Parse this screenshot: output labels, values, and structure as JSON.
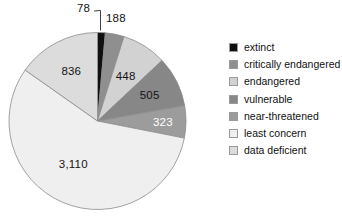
{
  "chart_data": {
    "type": "pie",
    "title": "",
    "subtitle": "",
    "xlabel": "",
    "ylabel": "",
    "legend_position": "right",
    "grid": false,
    "total": 5488,
    "start_angle_deg": 0,
    "direction": "clockwise",
    "categories": [
      "extinct",
      "critically endangered",
      "endangered",
      "vulnerable",
      "near-threatened",
      "least concern",
      "data deficient"
    ],
    "values": [
      78,
      188,
      448,
      505,
      323,
      3110,
      836
    ],
    "value_labels": [
      "78",
      "188",
      "448",
      "505",
      "323",
      "3,110",
      "836"
    ],
    "colors": [
      "#101010",
      "#8f8f8f",
      "#d2d2d2",
      "#878787",
      "#9c9c9c",
      "#efefef",
      "#dcdcdc"
    ],
    "slices": [
      {
        "name": "extinct",
        "value": 78,
        "label": "78",
        "color": "#101010",
        "label_color": "dark-text",
        "has_leader_line": true
      },
      {
        "name": "critically endangered",
        "value": 188,
        "label": "188",
        "color": "#8f8f8f",
        "label_color": "dark-text",
        "has_leader_line": false
      },
      {
        "name": "endangered",
        "value": 448,
        "label": "448",
        "color": "#d2d2d2",
        "label_color": "dark-text",
        "has_leader_line": false
      },
      {
        "name": "vulnerable",
        "value": 505,
        "label": "505",
        "color": "#878787",
        "label_color": "dark-text",
        "has_leader_line": false
      },
      {
        "name": "near-threatened",
        "value": 323,
        "label": "323",
        "color": "#9c9c9c",
        "label_color": "light-text",
        "has_leader_line": false
      },
      {
        "name": "least concern",
        "value": 3110,
        "label": "3,110",
        "color": "#efefef",
        "label_color": "dark-text",
        "has_leader_line": false
      },
      {
        "name": "data deficient",
        "value": 836,
        "label": "836",
        "color": "#dcdcdc",
        "label_color": "dark-text",
        "has_leader_line": false
      }
    ]
  },
  "legend": {
    "items": [
      {
        "label": "extinct",
        "color": "#101010"
      },
      {
        "label": "critically endangered",
        "color": "#8f8f8f"
      },
      {
        "label": "endangered",
        "color": "#d2d2d2"
      },
      {
        "label": "vulnerable",
        "color": "#878787"
      },
      {
        "label": "near-threatened",
        "color": "#9c9c9c"
      },
      {
        "label": "least concern",
        "color": "#efefef"
      },
      {
        "label": "data deficient",
        "color": "#dcdcdc"
      }
    ]
  },
  "style": {
    "background": "#ffffff",
    "slice_outline": "#8c8c8c",
    "leader_line": "#2a2a2a"
  }
}
